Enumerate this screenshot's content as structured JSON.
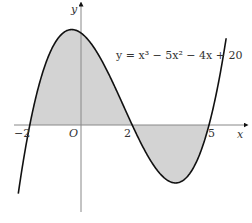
{
  "figure": {
    "equation": "y = x³ − 5x² − 4x + 20",
    "axes": {
      "x_label": "x",
      "y_label": "y",
      "origin_label": "O",
      "ticks": [
        "−2",
        "2",
        "5"
      ]
    },
    "roots": [
      -2,
      2,
      5
    ],
    "shaded_regions": [
      {
        "from": -2,
        "to": 2,
        "side": "above x-axis"
      },
      {
        "from": 2,
        "to": 5,
        "side": "below x-axis"
      }
    ],
    "colors": {
      "curve": "#111111",
      "axis": "#777777",
      "fill": "#d3d3d3"
    }
  }
}
